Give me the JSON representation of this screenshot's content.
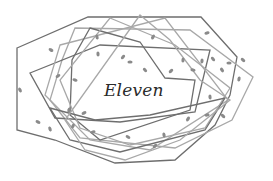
{
  "illustration": {
    "title": "Eleven",
    "stroke_color": "#6e6e6e",
    "light_stroke_color": "#a8a8a8",
    "leaf_color": "#8a8a8a",
    "polygons": [
      "17,48 88,17 201,17 237,57 230,95 215,125 175,160 115,163 55,140 17,130",
      "75,28 190,30 253,77 232,120 175,148 80,138 50,100 62,60",
      "30,73 100,45 210,50 195,112 120,122 55,118",
      "60,45 165,18 228,100 150,150 90,140 45,95",
      "90,28 140,42 165,78 195,80 190,110 100,140 70,115 72,60",
      "110,18 175,45 230,88 205,128 130,145 80,128 60,80",
      "50,108 95,120 150,115 225,98 205,130 120,152 70,140",
      "140,15 170,40 200,80 230,100 180,140 125,160 85,150 65,120"
    ],
    "leaves": [
      [
        51,
        50
      ],
      [
        97,
        37
      ],
      [
        153,
        37
      ],
      [
        207,
        33
      ],
      [
        243,
        60
      ],
      [
        98,
        54
      ],
      [
        123,
        57
      ],
      [
        130,
        62
      ],
      [
        145,
        70
      ],
      [
        183,
        60
      ],
      [
        171,
        71
      ],
      [
        193,
        70
      ],
      [
        222,
        70
      ],
      [
        239,
        79
      ],
      [
        58,
        76
      ],
      [
        75,
        80
      ],
      [
        20,
        90
      ],
      [
        69,
        110
      ],
      [
        84,
        113
      ],
      [
        38,
        122
      ],
      [
        50,
        129
      ],
      [
        73,
        126
      ],
      [
        93,
        132
      ],
      [
        128,
        137
      ],
      [
        164,
        135
      ],
      [
        188,
        119
      ],
      [
        207,
        115
      ],
      [
        223,
        116
      ],
      [
        210,
        97
      ],
      [
        155,
        146
      ],
      [
        229,
        63
      ],
      [
        213,
        59
      ],
      [
        202,
        61
      ]
    ]
  }
}
